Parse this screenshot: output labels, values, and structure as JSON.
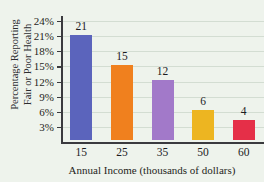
{
  "chart_data": {
    "type": "bar",
    "title": "",
    "xlabel": "Annual Income (thousands of dollars)",
    "ylabel_line1": "Percentage Reporting",
    "ylabel_line2": "Fair or Poor Health",
    "categories": [
      "15",
      "25",
      "35",
      "50",
      "60"
    ],
    "values": [
      21,
      15,
      12,
      6,
      4
    ],
    "value_labels": [
      "21",
      "15",
      "12",
      "6",
      "4"
    ],
    "bar_colors": [
      "#5b64bc",
      "#f0801e",
      "#a munderline",
      "#edb521",
      "#e52f48"
    ],
    "series": [
      {
        "name": "Percentage Reporting Fair or Poor Health",
        "values": [
          21,
          15,
          12,
          6,
          4
        ]
      }
    ],
    "ylim": [
      0,
      25
    ],
    "ytick_values": [
      3,
      6,
      9,
      12,
      15,
      18,
      21,
      24
    ],
    "ytick_labels": [
      "3%",
      "6%",
      "9%",
      "12%",
      "15%",
      "18%",
      "21%",
      "24%"
    ],
    "grid": true,
    "grid_axis": "y",
    "legend": false,
    "legend_position": "none",
    "background_color": "#eef3ec",
    "gridline_color": "#d3ddd2",
    "axis_color": "#3a3a3e"
  },
  "bars": [
    {
      "category": "15",
      "value": 21,
      "label": "21",
      "color": "#5b64bc"
    },
    {
      "category": "25",
      "value": 15,
      "label": "15",
      "color": "#f0801e"
    },
    {
      "category": "35",
      "value": 12,
      "label": "12",
      "color": "#a279c9"
    },
    {
      "category": "50",
      "value": 6,
      "label": "6",
      "color": "#edb521"
    },
    {
      "category": "60",
      "value": 4,
      "label": "4",
      "color": "#e52f48"
    }
  ]
}
